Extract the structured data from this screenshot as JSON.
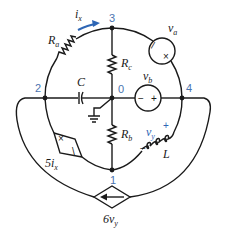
{
  "diagram": {
    "type": "circuit-schematic",
    "nodes": [
      {
        "id": "0",
        "label": "0"
      },
      {
        "id": "1",
        "label": "1"
      },
      {
        "id": "2",
        "label": "2"
      },
      {
        "id": "3",
        "label": "3"
      },
      {
        "id": "4",
        "label": "4"
      }
    ],
    "components": {
      "Ra": {
        "name": "R",
        "sub": "a",
        "kind": "resistor",
        "between": [
          "2",
          "3"
        ]
      },
      "Rc": {
        "name": "R",
        "sub": "c",
        "kind": "resistor",
        "between": [
          "3",
          "0"
        ]
      },
      "Rb": {
        "name": "R",
        "sub": "b",
        "kind": "resistor",
        "between": [
          "0",
          "1"
        ]
      },
      "C": {
        "name": "C",
        "kind": "capacitor",
        "between": [
          "2",
          "0"
        ]
      },
      "L": {
        "name": "L",
        "kind": "inductor",
        "between": [
          "1",
          "4"
        ]
      },
      "va": {
        "name": "v",
        "sub": "a",
        "kind": "voltage-source",
        "between": [
          "3",
          "4"
        ]
      },
      "vb": {
        "name": "v",
        "sub": "b",
        "kind": "voltage-source",
        "between": [
          "0",
          "4"
        ],
        "minus": "−",
        "plus": "+"
      },
      "dep5ix": {
        "coef": "5",
        "name": "i",
        "sub": "x",
        "kind": "dependent-voltage-source",
        "between": [
          "2",
          "1"
        ]
      },
      "dep6vy": {
        "coef": "6",
        "name": "v",
        "sub": "y",
        "kind": "dependent-current-source",
        "between": [
          "4",
          "2"
        ]
      }
    },
    "annotations": {
      "ix": {
        "name": "i",
        "sub": "x"
      },
      "vy": {
        "name": "v",
        "sub": "y",
        "plus": "+",
        "minus": "−"
      }
    },
    "colors": {
      "wire": "#1a1a1a",
      "node_label": "#4a74b0",
      "accent": "#2e66b5"
    }
  }
}
